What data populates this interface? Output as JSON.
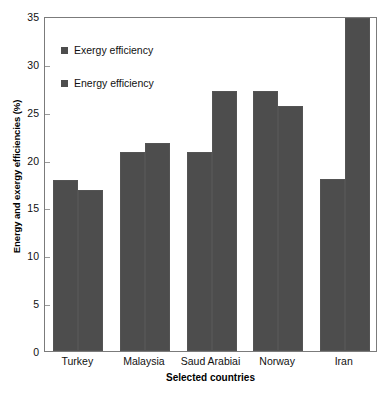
{
  "chart_data": {
    "type": "bar",
    "title": "",
    "xlabel": "Selected countries",
    "ylabel": "Energy and exergy efficiencies (%)",
    "categories": [
      "Turkey",
      "Malaysia",
      "Saud Arabiai",
      "Norway",
      "Iran"
    ],
    "series": [
      {
        "name": "Exergy efficiency",
        "values": [
          17.9,
          20.8,
          20.8,
          27.2,
          18.0
        ]
      },
      {
        "name": "Energy efficiency",
        "values": [
          16.8,
          21.7,
          27.2,
          25.6,
          34.8
        ]
      }
    ],
    "ylim": [
      0,
      35
    ],
    "yticks": [
      0,
      5,
      10,
      15,
      20,
      25,
      30,
      35
    ],
    "ytick_labels": [
      "0",
      "5",
      "10",
      "15",
      "20",
      "25",
      "30",
      "35"
    ],
    "grid": false,
    "legend_position": "upper left",
    "bar_color": "#4d4d4d",
    "frame_color": "#7b7b7b",
    "note": "Iran energy efficiency bar is clipped at the top of the plot axis"
  }
}
